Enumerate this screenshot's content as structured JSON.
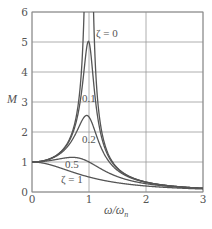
{
  "chart_data": {
    "type": "line",
    "title": "",
    "xlabel": "ω/ω_n",
    "ylabel": "M",
    "xlim": [
      0,
      3
    ],
    "ylim": [
      0,
      6
    ],
    "xticks": [
      "0",
      "1",
      "2",
      "3"
    ],
    "yticks": [
      "0",
      "1",
      "2",
      "3",
      "4",
      "5",
      "6"
    ],
    "grid": true,
    "legend": "none (inline annotations)",
    "formula": "M = 1 / sqrt((1 - r^2)^2 + (2 ζ r)^2), r = ω/ω_n",
    "x": [
      0,
      0.25,
      0.5,
      0.75,
      0.9,
      1.0,
      1.1,
      1.25,
      1.5,
      2.0,
      2.5,
      3.0
    ],
    "series": [
      {
        "name": "ζ = 0",
        "zeta": 0,
        "values": [
          1,
          1.067,
          1.333,
          2.286,
          5.263,
          null,
          4.762,
          1.778,
          0.8,
          0.333,
          0.19,
          0.125
        ]
      },
      {
        "name": "ζ = 0.1",
        "zeta": 0.1,
        "values": [
          1,
          1.065,
          1.322,
          2.162,
          3.821,
          5.0,
          3.288,
          1.625,
          0.778,
          0.33,
          0.19,
          0.125
        ]
      },
      {
        "name": "ζ = 0.2",
        "zeta": 0.2,
        "values": [
          1,
          1.061,
          1.288,
          1.885,
          2.457,
          2.5,
          2.051,
          1.329,
          0.721,
          0.322,
          0.187,
          0.124
        ]
      },
      {
        "name": "ζ = 0.5",
        "zeta": 0.5,
        "values": [
          1,
          1.031,
          1.109,
          1.152,
          1.087,
          1.0,
          0.893,
          0.73,
          0.512,
          0.277,
          0.172,
          0.117
        ]
      },
      {
        "name": "ζ = 1",
        "zeta": 1,
        "values": [
          1,
          0.941,
          0.8,
          0.64,
          0.552,
          0.5,
          0.452,
          0.39,
          0.308,
          0.2,
          0.138,
          0.1
        ]
      }
    ],
    "annotations": [
      {
        "text": "ζ = 0",
        "x": 96,
        "y": 37
      },
      {
        "text": "0.1",
        "x": 82,
        "y": 102
      },
      {
        "text": "0.2",
        "x": 82,
        "y": 143
      },
      {
        "text": "0.5",
        "x": 65,
        "y": 168
      },
      {
        "text": "ζ = 1",
        "x": 61,
        "y": 183
      }
    ]
  },
  "labels": {
    "y_axis": "M",
    "x_axis_main": "ω/ω",
    "x_axis_sub": "n"
  },
  "style": {
    "curve_color": "#555555",
    "grid_color": "#9a9a9a"
  }
}
